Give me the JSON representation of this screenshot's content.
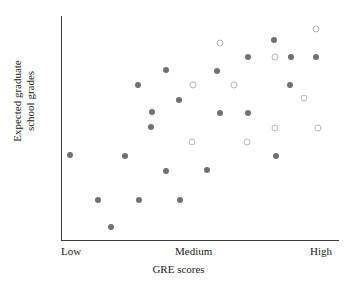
{
  "chart_data": {
    "type": "scatter",
    "title": "",
    "xlabel": "GRE scores",
    "ylabel_line1": "Expected graduate",
    "ylabel_line2": "school grades",
    "ylabel": "Expected graduate school grades",
    "x_tick_labels": [
      "Low",
      "Medium",
      "High"
    ],
    "y_tick_labels": [],
    "grid": false,
    "legend": "none",
    "xlim": [
      0,
      100
    ],
    "ylim": [
      0,
      100
    ],
    "series": [
      {
        "name": "filled",
        "marker": "filled-circle",
        "color": "#6f6f77",
        "points": [
          {
            "x": 2.9,
            "y": 38.0
          },
          {
            "x": 13.0,
            "y": 17.9
          },
          {
            "x": 17.8,
            "y": 5.8
          },
          {
            "x": 22.8,
            "y": 37.5
          },
          {
            "x": 27.9,
            "y": 17.9
          },
          {
            "x": 27.5,
            "y": 69.2
          },
          {
            "x": 32.2,
            "y": 50.4
          },
          {
            "x": 32.6,
            "y": 57.1
          },
          {
            "x": 37.7,
            "y": 30.8
          },
          {
            "x": 37.7,
            "y": 75.9
          },
          {
            "x": 42.4,
            "y": 62.5
          },
          {
            "x": 42.8,
            "y": 17.9
          },
          {
            "x": 52.5,
            "y": 31.3
          },
          {
            "x": 56.2,
            "y": 75.4
          },
          {
            "x": 57.2,
            "y": 56.7
          },
          {
            "x": 67.4,
            "y": 56.7
          },
          {
            "x": 67.4,
            "y": 81.7
          },
          {
            "x": 76.8,
            "y": 89.3
          },
          {
            "x": 77.5,
            "y": 37.5
          },
          {
            "x": 82.6,
            "y": 69.2
          },
          {
            "x": 83.0,
            "y": 81.7
          },
          {
            "x": 92.0,
            "y": 81.7
          }
        ]
      },
      {
        "name": "open",
        "marker": "open-circle",
        "color": "#b4b4bc",
        "points": [
          {
            "x": 47.1,
            "y": 43.8
          },
          {
            "x": 47.5,
            "y": 69.2
          },
          {
            "x": 57.2,
            "y": 88.0
          },
          {
            "x": 62.3,
            "y": 69.2
          },
          {
            "x": 67.0,
            "y": 43.8
          },
          {
            "x": 77.2,
            "y": 81.7
          },
          {
            "x": 77.2,
            "y": 50.0
          },
          {
            "x": 87.7,
            "y": 63.4
          },
          {
            "x": 92.0,
            "y": 94.2
          },
          {
            "x": 92.8,
            "y": 50.0
          }
        ]
      }
    ]
  },
  "axes": {
    "x_title": "GRE scores",
    "y_title_line1": "Expected graduate",
    "y_title_line2": "school grades",
    "ticks": {
      "low": "Low",
      "medium": "Medium",
      "high": "High"
    }
  },
  "colors": {
    "filled_marker": "#6f6f77",
    "open_marker": "#b4b4bc",
    "axis": "#3a3a3a",
    "text": "#1a1a1a",
    "background": "#ffffff"
  }
}
